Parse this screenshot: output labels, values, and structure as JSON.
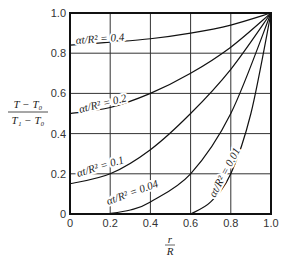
{
  "chart_data": {
    "type": "line",
    "title": "",
    "xlabel": "r/R",
    "ylabel": "(T - T0)/(T1 - T0)",
    "xlim": [
      0,
      1.0
    ],
    "ylim": [
      0,
      1.0
    ],
    "grid": true,
    "legend": "inline curve labels",
    "x_ticks": [
      "0",
      "0.2",
      "0.4",
      "0.6",
      "0.8",
      "1.0"
    ],
    "y_ticks": [
      "0",
      "0.2",
      "0.4",
      "0.6",
      "0.8",
      "1.0"
    ],
    "series": [
      {
        "name": "αt/R² = 0.4",
        "label": "αt/R² = 0.4",
        "points": [
          [
            0,
            0.84
          ],
          [
            0.2,
            0.855
          ],
          [
            0.4,
            0.872
          ],
          [
            0.6,
            0.9
          ],
          [
            0.8,
            0.94
          ],
          [
            1.0,
            1.0
          ]
        ]
      },
      {
        "name": "αt/R² = 0.2",
        "label": "αt/R² = 0.2",
        "points": [
          [
            0,
            0.5
          ],
          [
            0.2,
            0.53
          ],
          [
            0.4,
            0.6
          ],
          [
            0.6,
            0.7
          ],
          [
            0.8,
            0.83
          ],
          [
            1.0,
            1.0
          ]
        ]
      },
      {
        "name": "αt/R² = 0.1",
        "label": "αt/R² = 0.1",
        "points": [
          [
            0,
            0.15
          ],
          [
            0.2,
            0.2
          ],
          [
            0.4,
            0.32
          ],
          [
            0.6,
            0.5
          ],
          [
            0.8,
            0.72
          ],
          [
            1.0,
            1.0
          ]
        ]
      },
      {
        "name": "αt/R² = 0.04",
        "label": "αt/R² = 0.04",
        "points": [
          [
            0.18,
            0
          ],
          [
            0.3,
            0.02
          ],
          [
            0.4,
            0.06
          ],
          [
            0.6,
            0.2
          ],
          [
            0.8,
            0.5
          ],
          [
            1.0,
            1.0
          ]
        ]
      },
      {
        "name": "αt/R² = 0.01",
        "label": "αt/R² = 0.01",
        "points": [
          [
            0.6,
            0
          ],
          [
            0.7,
            0.06
          ],
          [
            0.8,
            0.2
          ],
          [
            0.9,
            0.5
          ],
          [
            1.0,
            1.0
          ]
        ]
      }
    ]
  },
  "axes": {
    "x_label_num": "r",
    "x_label_den": "R",
    "y_label_num": "T − T₀",
    "y_label_den": "T₁ − T₀"
  }
}
